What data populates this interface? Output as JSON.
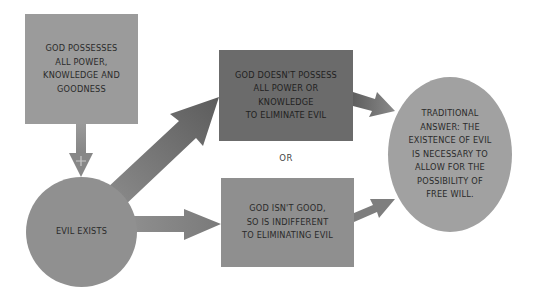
{
  "diagram": {
    "nodes": {
      "premise": {
        "label": "GOD POSSESSES\nALL POWER,\nKNOWLEDGE AND\nGOODNESS"
      },
      "evil_exists": {
        "label": "EVIL EXISTS"
      },
      "not_powerful": {
        "label": "GOD DOESN'T POSSESS\nALL POWER OR\nKNOWLEDGE\nTO ELIMINATE EVIL"
      },
      "not_good": {
        "label": "GOD ISN'T GOOD,\nSO IS INDIFFERENT\nTO ELIMINATING EVIL"
      },
      "traditional_answer": {
        "label": "TRADITIONAL\nANSWER: THE\nEXISTENCE OF EVIL\nIS NECESSARY TO\nALLOW FOR THE\nPOSSIBILITY OF\nFREE WILL."
      }
    },
    "connector_or": "OR",
    "plus_symbol": "+",
    "colors": {
      "premise": "#9b9b9b",
      "not_powerful": "#6b6b6b",
      "not_good": "#8f8f8f",
      "evil_exists": "#909090",
      "traditional_answer": "#a1a1a1",
      "arrow_light": "#8a8a8a",
      "arrow_dark": "#5e5e5e",
      "text": "#2a2a2a"
    },
    "edges": [
      {
        "from": "premise",
        "to": "evil_exists",
        "label": "+"
      },
      {
        "from": "evil_exists",
        "to": "not_powerful"
      },
      {
        "from": "evil_exists",
        "to": "not_good"
      },
      {
        "from": "not_powerful",
        "to": "traditional_answer"
      },
      {
        "from": "not_good",
        "to": "traditional_answer"
      }
    ]
  }
}
